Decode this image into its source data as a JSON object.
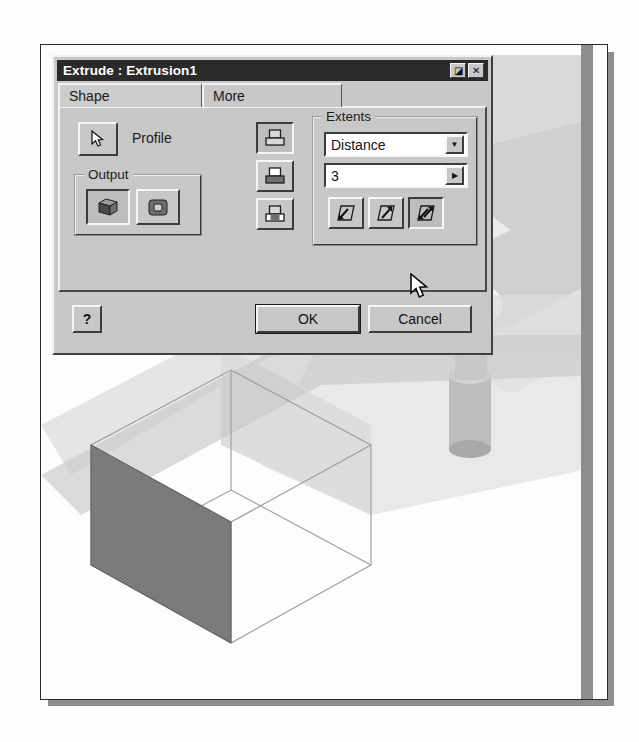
{
  "dialog": {
    "title": "Extrude : Extrusion1",
    "titlebar_buttons": [
      {
        "name": "context-help-button",
        "glyph": "◪"
      },
      {
        "name": "close-button",
        "glyph": "✕"
      }
    ],
    "tabs": [
      {
        "label": "Shape",
        "active": true
      },
      {
        "label": "More",
        "active": false
      }
    ],
    "shape_tab": {
      "profile": {
        "button_icon": "arrow-cursor-icon",
        "label": "Profile"
      },
      "output_group": {
        "title": "Output",
        "buttons": [
          {
            "name": "output-solid-button",
            "icon": "solid-cube-icon",
            "selected": true
          },
          {
            "name": "output-surface-button",
            "icon": "surface-icon",
            "selected": false
          }
        ]
      },
      "operation_buttons": [
        {
          "name": "operation-join-button",
          "icon": "boolean-join-icon",
          "selected": true
        },
        {
          "name": "operation-cut-button",
          "icon": "boolean-cut-icon",
          "selected": false
        },
        {
          "name": "operation-intersect-button",
          "icon": "boolean-intersect-icon",
          "selected": false
        }
      ],
      "extents_group": {
        "title": "Extents",
        "type_select": {
          "value": "Distance",
          "options": [
            "Distance",
            "To Next",
            "To",
            "From To",
            "All"
          ]
        },
        "distance_value": "3",
        "distance_more_glyph": "▶",
        "direction_buttons": [
          {
            "name": "direction-normal-button",
            "icon": "extrude-direction-1-icon",
            "selected": false
          },
          {
            "name": "direction-flipped-button",
            "icon": "extrude-direction-2-icon",
            "selected": false
          },
          {
            "name": "direction-symmetric-button",
            "icon": "extrude-direction-symmetric-icon",
            "selected": true
          }
        ]
      }
    },
    "footer": {
      "help_label": "?",
      "ok_label": "OK",
      "cancel_label": "Cancel"
    }
  },
  "viewport": {
    "model": "extruded-rectangle-preview",
    "wireframe_box_label": "",
    "shaded_profile_label": ""
  },
  "colors": {
    "dialog_face": "#c8c8c8",
    "titlebar": "#2a2a2a",
    "titlebar_text": "#ffffff",
    "field_bg": "#ffffff",
    "shaded_face": "#7b7b7b",
    "page": "#fdfdfd"
  }
}
